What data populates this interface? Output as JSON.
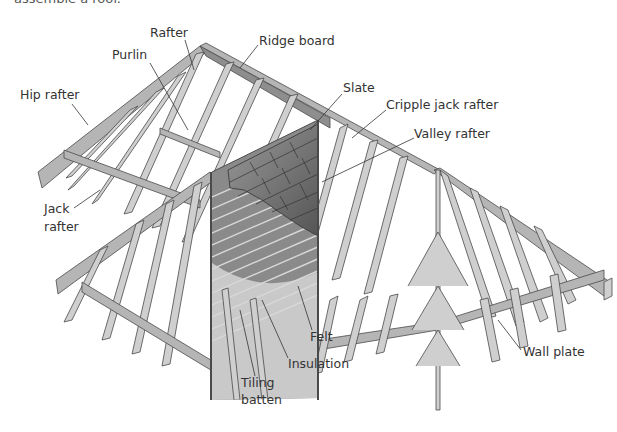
{
  "caption": "assemble a roof.",
  "diagram": {
    "labels": {
      "rafter": "Rafter",
      "purlin": "Purlin",
      "ridge_board": "Ridge board",
      "hip_rafter": "Hip rafter",
      "slate": "Slate",
      "cripple_jack_rafter": "Cripple jack rafter",
      "valley_rafter": "Valley rafter",
      "jack_rafter_line1": "Jack",
      "jack_rafter_line2": "rafter",
      "felt": "Felt",
      "insulation": "Insulation",
      "tiling_batten_line1": "Tiling",
      "tiling_batten_line2": "batten",
      "wall_plate": "Wall plate"
    }
  }
}
